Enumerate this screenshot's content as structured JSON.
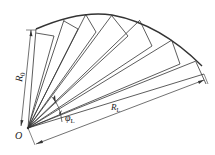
{
  "diagram": {
    "type": "fan-shaped rib structure",
    "stroke_color": "#333333",
    "labels": {
      "origin": "O",
      "inner_radius": "R",
      "inner_radius_sub": "0",
      "outer_radius": "R",
      "outer_radius_sub": "L",
      "angle": "φ",
      "angle_sub": "L"
    }
  }
}
